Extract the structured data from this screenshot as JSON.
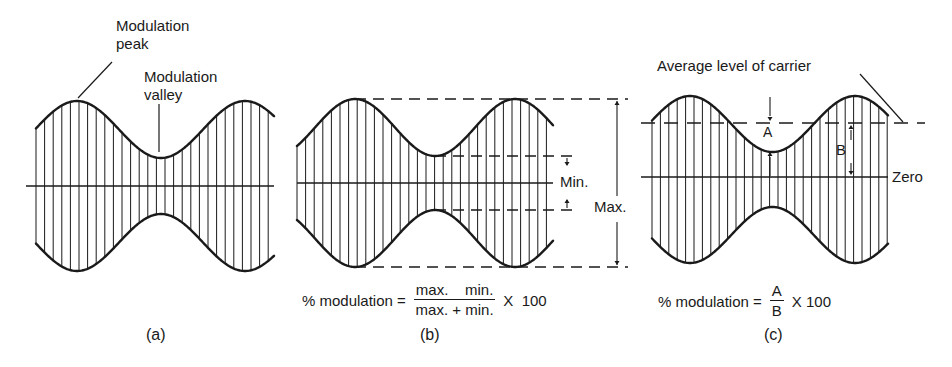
{
  "figure": {
    "panels": [
      {
        "id": "a",
        "caption": "(a)",
        "labels": {
          "peak": [
            "Modulation",
            "peak"
          ],
          "valley": [
            "Modulation",
            "valley"
          ]
        }
      },
      {
        "id": "b",
        "caption": "(b)",
        "labels": {
          "min": "Min.",
          "max": "Max."
        },
        "formula": {
          "lhs": "% modulation =",
          "numerator": "max.    min.",
          "denominator": "max. + min.",
          "multiplier": "X  100"
        }
      },
      {
        "id": "c",
        "caption": "(c)",
        "labels": {
          "average": "Average level of carrier",
          "a": "A",
          "b": "B",
          "zero": "Zero"
        },
        "formula": {
          "lhs": "% modulation =",
          "numerator": "A",
          "denominator": "B",
          "multiplier": "X 100"
        }
      }
    ],
    "colors": {
      "ink": "#1a1a1a",
      "background": "#ffffff"
    }
  }
}
